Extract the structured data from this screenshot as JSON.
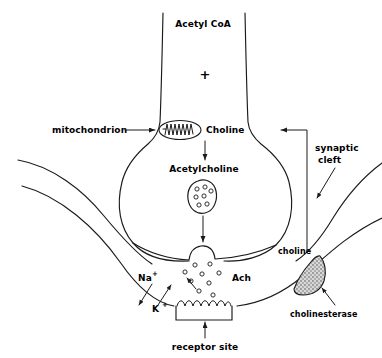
{
  "diagram": {
    "labels": {
      "acetyl_coa": "Acetyl CoA",
      "plus": "+",
      "mitochondrion": "mitochondrion",
      "choline_top": "Choline",
      "acetylcholine": "Acetylcholine",
      "synaptic_cleft_line1": "synaptic",
      "synaptic_cleft_line2": "cleft",
      "choline_cleft": "choline",
      "cholinesterase": "cholinesterase",
      "ach": "Ach",
      "sodium": "Na",
      "sodium_charge": "+",
      "potassium": "K",
      "potassium_charge": "+",
      "receptor_site": "receptor site"
    },
    "colors": {
      "ink": "#1a1a1a",
      "background": "#ffffff",
      "enzyme_fill": "#b9b9b9"
    },
    "vesicle": {
      "transmitter_count": 7
    },
    "cleft_transmitter_count": 9
  }
}
